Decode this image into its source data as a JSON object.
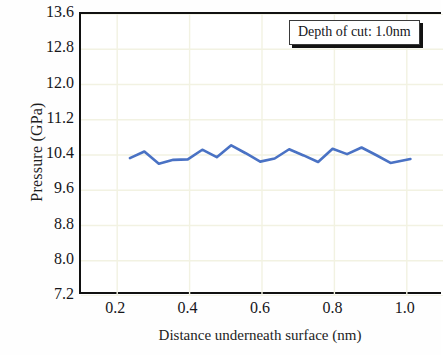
{
  "chart_data": {
    "type": "line",
    "title": "",
    "xlabel": "Distance underneath surface (nm)",
    "ylabel": "Pressure (GPa)",
    "xlim": [
      0.1,
      1.1
    ],
    "ylim": [
      7.2,
      13.6
    ],
    "xticks": [
      "0.2",
      "0.4",
      "0.6",
      "0.8",
      "1.0"
    ],
    "xtick_values": [
      0.2,
      0.4,
      0.6,
      0.8,
      1.0
    ],
    "yticks": [
      "13.6",
      "12.8",
      "12.0",
      "11.2",
      "10.4",
      "9.6",
      "8.8",
      "8.0",
      "7.2"
    ],
    "ytick_values": [
      13.6,
      12.8,
      12.0,
      11.2,
      10.4,
      9.6,
      8.8,
      8.0,
      7.2
    ],
    "grid": true,
    "grid_color": "#f2f2e2",
    "legend_position": "top-right",
    "series": [
      {
        "name": "Depth of cut: 1.0nm",
        "color": "#4a72c4",
        "line_width": 2.6,
        "x": [
          0.235,
          0.275,
          0.315,
          0.355,
          0.395,
          0.435,
          0.475,
          0.515,
          0.555,
          0.595,
          0.635,
          0.675,
          0.715,
          0.755,
          0.795,
          0.835,
          0.875,
          0.915,
          0.955,
          1.01
        ],
        "y": [
          10.33,
          10.48,
          10.2,
          10.29,
          10.3,
          10.52,
          10.35,
          10.62,
          10.44,
          10.25,
          10.32,
          10.53,
          10.39,
          10.24,
          10.54,
          10.42,
          10.57,
          10.4,
          10.22,
          10.31
        ]
      }
    ]
  },
  "legend": {
    "label": "Depth of cut: 1.0nm"
  }
}
